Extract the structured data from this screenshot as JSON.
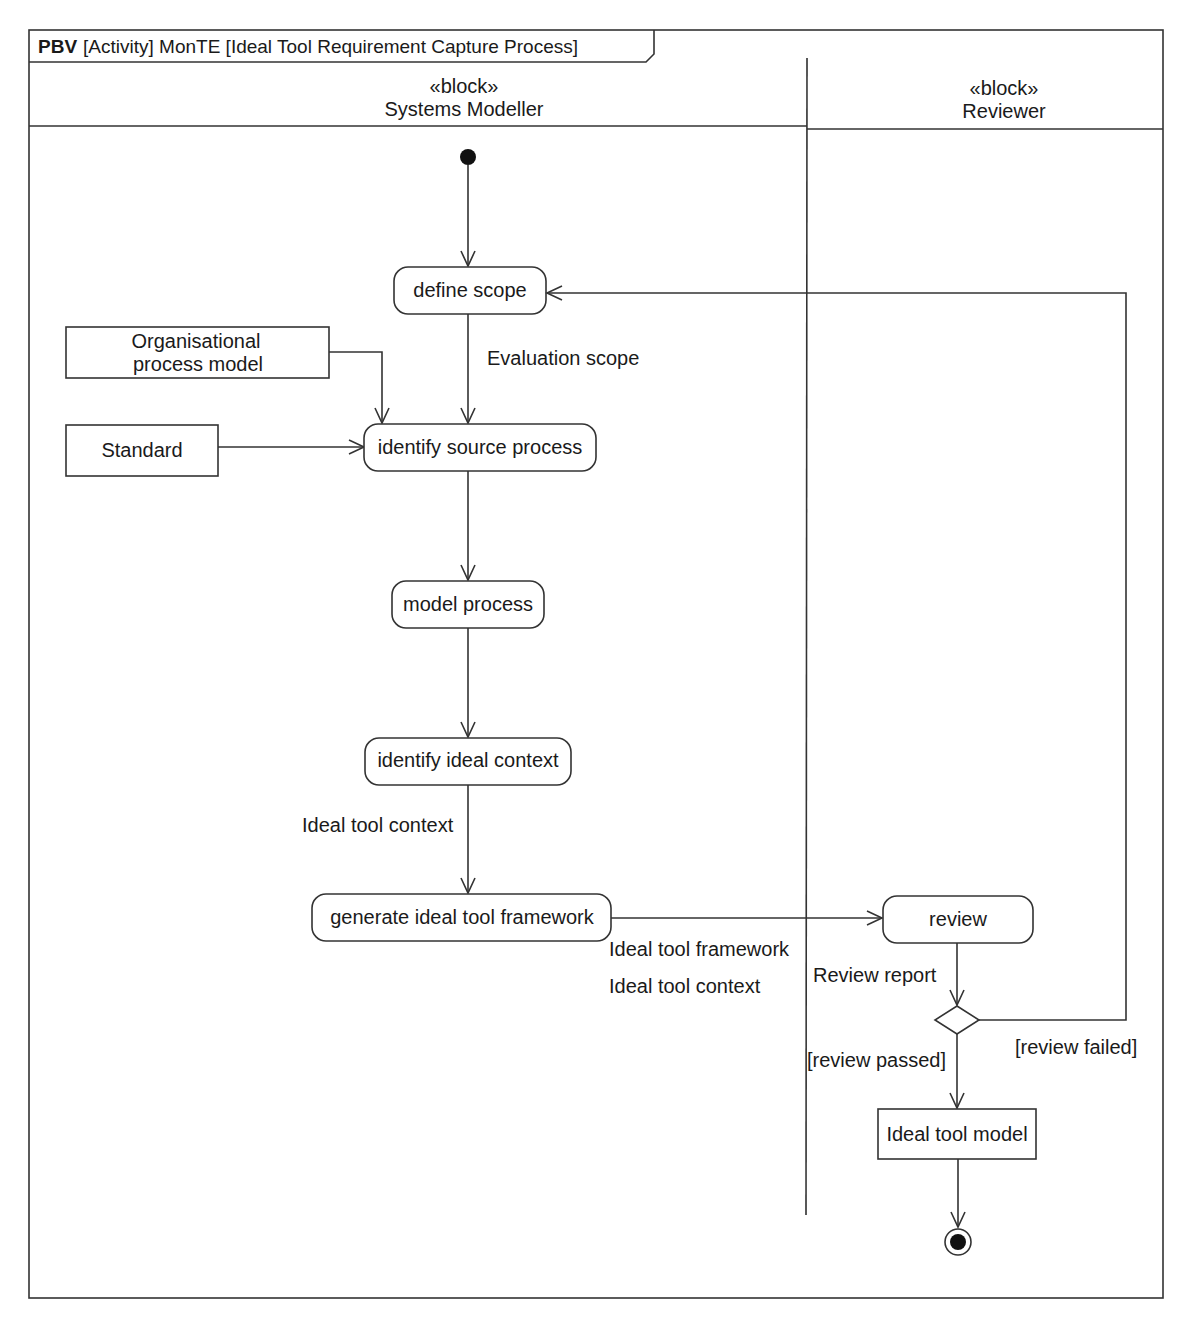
{
  "frame": {
    "keyword": "PBV",
    "title": "[Activity] MonTE [Ideal Tool Requirement Capture Process]"
  },
  "swimlanes": [
    {
      "stereotype": "«block»",
      "name": "Systems Modeller"
    },
    {
      "stereotype": "«block»",
      "name": "Reviewer"
    }
  ],
  "actions": {
    "define_scope": "define scope",
    "identify_source_process": "identify source process",
    "model_process": "model process",
    "identify_ideal_context": "identify ideal context",
    "generate_framework": "generate ideal tool framework",
    "review": "review"
  },
  "objects": {
    "org_process_model_line1": "Organisational",
    "org_process_model_line2": "process model",
    "standard": "Standard",
    "ideal_tool_model": "Ideal tool model"
  },
  "flow_labels": {
    "evaluation_scope": "Evaluation scope",
    "ideal_tool_context_1": "Ideal tool context",
    "ideal_tool_framework": "Ideal tool framework",
    "ideal_tool_context_2": "Ideal tool context",
    "review_report": "Review report",
    "review_passed": "[review passed]",
    "review_failed": "[review failed]"
  },
  "colors": {
    "line": "#333333",
    "text": "#1a1a1a",
    "background": "#ffffff"
  }
}
